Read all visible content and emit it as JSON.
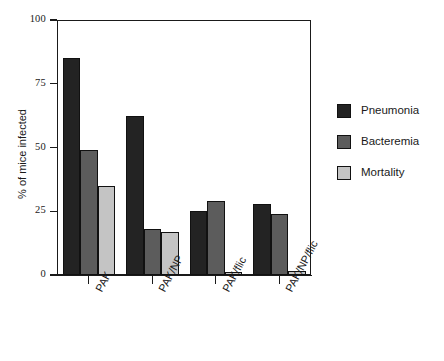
{
  "chart_data": {
    "type": "bar",
    "title": "",
    "subtitle": "",
    "xlabel": "",
    "ylabel": "% of mice infected",
    "ylim": [
      0,
      100
    ],
    "yticks": [
      0,
      25,
      50,
      75,
      100
    ],
    "ytick_labels": [
      "0",
      "25",
      "50",
      "75",
      "100"
    ],
    "grid": false,
    "legend_position": "right",
    "categories": [
      "PAK",
      "PAK/NP",
      "PAK/flic",
      "PAK/NP/flic"
    ],
    "series": [
      {
        "name": "Pneumonia",
        "color": "#232323",
        "values": [
          85,
          62.5,
          25,
          28
        ]
      },
      {
        "name": "Bacteremia",
        "color": "#5c5c5c",
        "values": [
          49,
          18,
          29,
          24
        ]
      },
      {
        "name": "Mortality",
        "color": "#c4c4c4",
        "values": [
          35,
          17,
          1,
          1.5
        ]
      }
    ]
  },
  "axis": {
    "y_title": "% of mice infected",
    "y_ticks": [
      "100",
      "75",
      "50",
      "25",
      "0"
    ],
    "x_labels": [
      "PAK",
      "PAK/NP",
      "PAK/flic",
      "PAK/NP/flic"
    ]
  },
  "legend": {
    "items": [
      {
        "label": "Pneumonia",
        "color": "#232323"
      },
      {
        "label": "Bacteremia",
        "color": "#5c5c5c"
      },
      {
        "label": "Mortality",
        "color": "#c4c4c4"
      }
    ]
  }
}
